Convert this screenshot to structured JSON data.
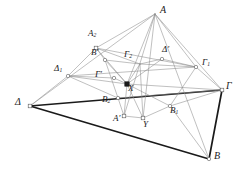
{
  "figure": {
    "background": "#ffffff",
    "stroke_light": "#8c8c8c",
    "stroke_mid": "#5a5a5a",
    "stroke_bold": "#1a1a1a",
    "label_color": "#1a1a1a",
    "width": 240,
    "height": 178
  },
  "points": [
    {
      "id": "A",
      "label": "A",
      "sub": "",
      "x": 155,
      "y": 14,
      "lx": 160,
      "ly": 5,
      "marker": "none",
      "size": "big"
    },
    {
      "id": "A2",
      "label": "Α",
      "sub": "2",
      "x": 96,
      "y": 48,
      "lx": 88,
      "ly": 29,
      "marker": "square",
      "size": "mid"
    },
    {
      "id": "Bprime",
      "label": "B",
      "sub": "",
      "x": 105,
      "y": 60,
      "lx": 91,
      "ly": 48,
      "marker": "circle",
      "size": "mid",
      "prime": true
    },
    {
      "id": "Dprime",
      "label": "Δ",
      "sub": "",
      "x": 162,
      "y": 59,
      "lx": 162,
      "ly": 45,
      "marker": "circle",
      "size": "mid",
      "prime": true
    },
    {
      "id": "G2",
      "label": "Γ",
      "sub": "2",
      "x": 140,
      "y": 64,
      "lx": 124,
      "ly": 50,
      "marker": "none",
      "size": "mid"
    },
    {
      "id": "G1",
      "label": "Γ",
      "sub": "1",
      "x": 196,
      "y": 67,
      "lx": 202,
      "ly": 58,
      "marker": "circle",
      "size": "mid"
    },
    {
      "id": "D1",
      "label": "Δ",
      "sub": "1",
      "x": 68,
      "y": 76,
      "lx": 54,
      "ly": 64,
      "marker": "circle",
      "size": "mid"
    },
    {
      "id": "Gprime",
      "label": "Γ",
      "sub": "",
      "x": 114,
      "y": 78,
      "lx": 95,
      "ly": 70,
      "marker": "circle",
      "size": "mid",
      "prime": true
    },
    {
      "id": "X",
      "label": "X",
      "sub": "",
      "x": 127,
      "y": 84,
      "lx": 128,
      "ly": 84,
      "marker": "fsquare",
      "size": "mid"
    },
    {
      "id": "D",
      "label": "Δ",
      "sub": "",
      "x": 30,
      "y": 106,
      "lx": 15,
      "ly": 97,
      "marker": "square",
      "size": "big"
    },
    {
      "id": "G",
      "label": "Γ",
      "sub": "",
      "x": 222,
      "y": 90,
      "lx": 226,
      "ly": 81,
      "marker": "square",
      "size": "big"
    },
    {
      "id": "B2",
      "label": "B",
      "sub": "2",
      "x": 118,
      "y": 98,
      "lx": 102,
      "ly": 95,
      "marker": "circle",
      "size": "mid"
    },
    {
      "id": "B1",
      "label": "B",
      "sub": "1",
      "x": 170,
      "y": 106,
      "lx": 170,
      "ly": 106,
      "marker": "circle",
      "size": "mid"
    },
    {
      "id": "Aprime",
      "label": "Α",
      "sub": "",
      "x": 124,
      "y": 116,
      "lx": 113,
      "ly": 114,
      "marker": "square",
      "size": "mid",
      "prime": true
    },
    {
      "id": "Y",
      "label": "Y",
      "sub": "",
      "x": 143,
      "y": 118,
      "lx": 143,
      "ly": 120,
      "marker": "square",
      "size": "mid"
    },
    {
      "id": "B",
      "label": "B",
      "sub": "",
      "x": 209,
      "y": 159,
      "lx": 214,
      "ly": 151,
      "marker": "circle",
      "size": "big"
    }
  ],
  "edges": [
    {
      "from": "D",
      "to": "A",
      "weight": "light"
    },
    {
      "from": "D",
      "to": "G",
      "weight": "bold"
    },
    {
      "from": "D",
      "to": "B",
      "weight": "bold"
    },
    {
      "from": "B",
      "to": "G",
      "weight": "bold"
    },
    {
      "from": "A",
      "to": "G",
      "weight": "light"
    },
    {
      "from": "A",
      "to": "B",
      "weight": "light"
    },
    {
      "from": "A",
      "to": "A2",
      "weight": "light"
    },
    {
      "from": "A",
      "to": "G1",
      "weight": "light"
    },
    {
      "from": "A",
      "to": "Y",
      "weight": "light"
    },
    {
      "from": "A",
      "to": "X",
      "weight": "light"
    },
    {
      "from": "A",
      "to": "Aprime",
      "weight": "light"
    },
    {
      "from": "D",
      "to": "D1",
      "weight": "light"
    },
    {
      "from": "D1",
      "to": "A2",
      "weight": "light"
    },
    {
      "from": "D1",
      "to": "G1",
      "weight": "light"
    },
    {
      "from": "D1",
      "to": "Gprime",
      "weight": "light"
    },
    {
      "from": "D1",
      "to": "X",
      "weight": "light"
    },
    {
      "from": "D1",
      "to": "B2",
      "weight": "light"
    },
    {
      "from": "A2",
      "to": "G1",
      "weight": "light"
    },
    {
      "from": "A2",
      "to": "Bprime",
      "weight": "light"
    },
    {
      "from": "A2",
      "to": "G2",
      "weight": "light"
    },
    {
      "from": "A2",
      "to": "X",
      "weight": "light"
    },
    {
      "from": "Bprime",
      "to": "X",
      "weight": "light"
    },
    {
      "from": "Bprime",
      "to": "B2",
      "weight": "light"
    },
    {
      "from": "Bprime",
      "to": "G2",
      "weight": "light"
    },
    {
      "from": "G2",
      "to": "Dprime",
      "weight": "light"
    },
    {
      "from": "G2",
      "to": "G1",
      "weight": "light"
    },
    {
      "from": "G2",
      "to": "X",
      "weight": "light"
    },
    {
      "from": "G1",
      "to": "G",
      "weight": "light"
    },
    {
      "from": "G1",
      "to": "B1",
      "weight": "light"
    },
    {
      "from": "Gprime",
      "to": "X",
      "weight": "light"
    },
    {
      "from": "X",
      "to": "G",
      "weight": "light"
    },
    {
      "from": "X",
      "to": "B1",
      "weight": "light"
    },
    {
      "from": "X",
      "to": "Aprime",
      "weight": "light"
    },
    {
      "from": "X",
      "to": "Y",
      "weight": "light"
    },
    {
      "from": "B2",
      "to": "Aprime",
      "weight": "light"
    },
    {
      "from": "B2",
      "to": "G",
      "weight": "light"
    },
    {
      "from": "Aprime",
      "to": "Y",
      "weight": "light"
    },
    {
      "from": "Y",
      "to": "B1",
      "weight": "light"
    },
    {
      "from": "Y",
      "to": "G2",
      "weight": "light"
    },
    {
      "from": "B1",
      "to": "B",
      "weight": "light"
    },
    {
      "from": "B1",
      "to": "G",
      "weight": "light"
    },
    {
      "from": "Dprime",
      "to": "G1",
      "weight": "light"
    },
    {
      "from": "Dprime",
      "to": "X",
      "weight": "light"
    }
  ]
}
